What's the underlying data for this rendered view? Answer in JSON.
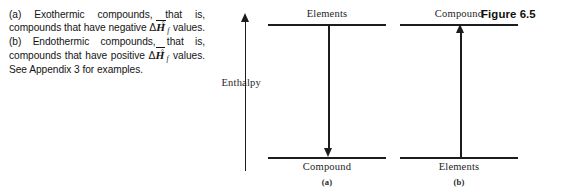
{
  "figure": {
    "number_label": "Figure 6.5",
    "axis_label": "Enthalpy"
  },
  "caption": {
    "part_a_marker": "(a)",
    "part_a_text_1": "Exothermic compounds, that is, compounds that have negative ",
    "part_a_symbol": {
      "delta": "Δ",
      "h": "H",
      "subscript": "f",
      "superscript": "°"
    },
    "part_a_text_2": " values. ",
    "part_b_marker": "(b)",
    "part_b_text_1": "Endothermic compounds, that is, compounds that have positive ",
    "part_b_text_2": " values. ",
    "closing_text": "See Appendix 3 for examples."
  },
  "panels": [
    {
      "id": "a",
      "caption": "(a)",
      "top_level_label": "Elements",
      "bottom_level_label": "Compound",
      "arrow_direction": "down"
    },
    {
      "id": "b",
      "caption": "(b)",
      "top_level_label": "Compound",
      "bottom_level_label": "Elements",
      "arrow_direction": "up"
    }
  ],
  "colors": {
    "ink": "#1c1c1c",
    "background": "#ffffff",
    "text": "#141414"
  }
}
